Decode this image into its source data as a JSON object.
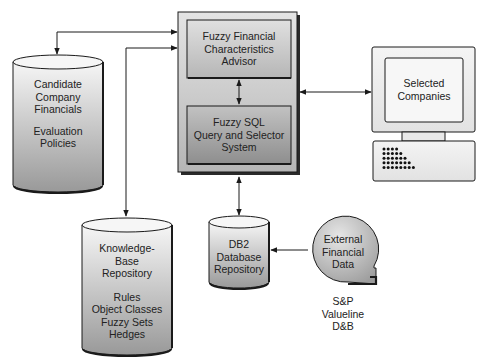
{
  "nodes": {
    "candidate_financials": {
      "type": "cylinder",
      "lines_top": [
        "Candidate",
        "Company",
        "Financials"
      ],
      "lines_bottom": [
        "Evaluation",
        "Policies"
      ]
    },
    "advisor": {
      "type": "box",
      "lines": [
        "Fuzzy Financial",
        "Characteristics",
        "Advisor"
      ]
    },
    "fuzzy_sql": {
      "type": "box",
      "lines": [
        "Fuzzy SQL",
        "Query and Selector",
        "System"
      ]
    },
    "selected_companies": {
      "type": "computer",
      "lines": [
        "Selected",
        "Companies"
      ]
    },
    "knowledge_base": {
      "type": "cylinder",
      "lines_top": [
        "Knowledge-",
        "Base",
        "Repository"
      ],
      "lines_bottom": [
        "Rules",
        "Object Classes",
        "Fuzzy Sets",
        "Hedges"
      ]
    },
    "db2": {
      "type": "cylinder",
      "lines": [
        "DB2",
        "Database",
        "Repository"
      ]
    },
    "external_data": {
      "type": "data-bubble",
      "lines": [
        "External",
        "Financial",
        "Data"
      ]
    },
    "external_sources": {
      "type": "caption",
      "lines": [
        "S&P",
        "Valueline",
        "D&B"
      ]
    }
  },
  "edges": [
    {
      "from": "candidate_financials",
      "to": "advisor",
      "direction": "bidirectional"
    },
    {
      "from": "knowledge_base",
      "to": "advisor",
      "direction": "bidirectional"
    },
    {
      "from": "advisor",
      "to": "fuzzy_sql",
      "direction": "bidirectional"
    },
    {
      "from": "advisor_system",
      "to": "selected_companies",
      "direction": "bidirectional"
    },
    {
      "from": "advisor_system",
      "to": "db2",
      "direction": "bidirectional"
    },
    {
      "from": "external_data",
      "to": "db2",
      "direction": "forward"
    }
  ],
  "colors": {
    "outline": "#1a1a1a",
    "cylinder_top": "#f4f4f4",
    "cylinder_bottom": "#9a9a9a",
    "outer_box_light": "#e2e2e2",
    "outer_box_dark": "#b8b8b8",
    "inner_box_top_light": "#dcdcdc",
    "inner_box_top_dark": "#b4b4b4",
    "inner_box_bottom_light": "#bdbdbd",
    "inner_box_bottom_dark": "#8f8f8f",
    "monitor": "#ededed"
  }
}
